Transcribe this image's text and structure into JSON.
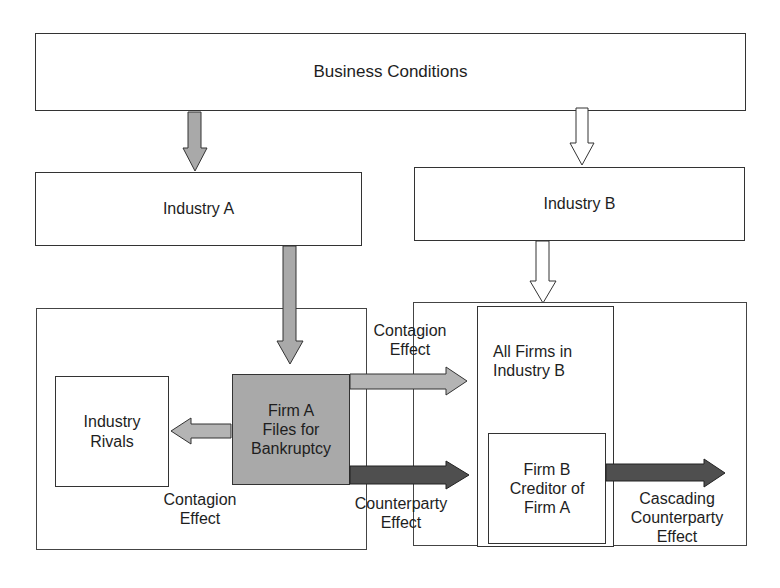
{
  "diagram": {
    "nodes": {
      "business_conditions": "Business Conditions",
      "industry_a": "Industry A",
      "industry_b": "Industry B",
      "industry_rivals": "Industry\nRivals",
      "firm_a": "Firm A\nFiles for\nBankruptcy",
      "all_firms_industry_b": "All Firms in\nIndustry B",
      "firm_b": "Firm B\nCreditor of\nFirm A"
    },
    "edge_labels": {
      "contagion_to_rivals": "Contagion\nEffect",
      "contagion_to_industry_b": "Contagion\nEffect",
      "counterparty": "Counterparty\nEffect",
      "cascading_counterparty": "Cascading\nCounterparty\nEffect"
    },
    "colors": {
      "firm_a_fill": "#a9a9a9",
      "contagion_arrow": "#b4b4b4",
      "counterparty_arrow": "#4f4f4f",
      "industry_b_arrow": "#ffffff",
      "industry_a_arrow": "#a9a9a9"
    }
  }
}
